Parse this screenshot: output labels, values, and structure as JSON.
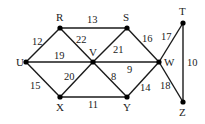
{
  "diagram": {
    "type": "weighted-undirected-graph",
    "nodes": [
      {
        "id": "U",
        "x": 26,
        "y": 62,
        "lx": 16,
        "ly": 66
      },
      {
        "id": "R",
        "x": 60,
        "y": 28,
        "lx": 56,
        "ly": 21
      },
      {
        "id": "V",
        "x": 93,
        "y": 62,
        "lx": 89,
        "ly": 56
      },
      {
        "id": "X",
        "x": 60,
        "y": 97,
        "lx": 56,
        "ly": 111
      },
      {
        "id": "S",
        "x": 127,
        "y": 28,
        "lx": 123,
        "ly": 21
      },
      {
        "id": "W",
        "x": 159,
        "y": 62,
        "lx": 164,
        "ly": 66
      },
      {
        "id": "Y",
        "x": 127,
        "y": 97,
        "lx": 123,
        "ly": 111
      },
      {
        "id": "T",
        "x": 183,
        "y": 23,
        "lx": 179,
        "ly": 15
      },
      {
        "id": "Z",
        "x": 183,
        "y": 102,
        "lx": 179,
        "ly": 116
      }
    ],
    "edges": [
      {
        "from": "U",
        "to": "R",
        "weight": "12",
        "lx": 32,
        "ly": 45
      },
      {
        "from": "U",
        "to": "V",
        "weight": "19",
        "lx": 54,
        "ly": 59
      },
      {
        "from": "U",
        "to": "X",
        "weight": "15",
        "lx": 30,
        "ly": 89
      },
      {
        "from": "R",
        "to": "S",
        "weight": "13",
        "lx": 87,
        "ly": 23
      },
      {
        "from": "R",
        "to": "V",
        "weight": "22",
        "lx": 76,
        "ly": 43
      },
      {
        "from": "X",
        "to": "V",
        "weight": "20",
        "lx": 64,
        "ly": 80
      },
      {
        "from": "X",
        "to": "Y",
        "weight": "11",
        "lx": 88,
        "ly": 108
      },
      {
        "from": "V",
        "to": "S",
        "weight": "21",
        "lx": 113,
        "ly": 53
      },
      {
        "from": "V",
        "to": "W",
        "weight": "9",
        "lx": 127,
        "ly": 73
      },
      {
        "from": "V",
        "to": "Y",
        "weight": "8",
        "lx": 111,
        "ly": 80
      },
      {
        "from": "S",
        "to": "W",
        "weight": "16",
        "lx": 142,
        "ly": 42
      },
      {
        "from": "Y",
        "to": "W",
        "weight": "14",
        "lx": 140,
        "ly": 91
      },
      {
        "from": "W",
        "to": "T",
        "weight": "17",
        "lx": 161,
        "ly": 40
      },
      {
        "from": "W",
        "to": "Z",
        "weight": "18",
        "lx": 160,
        "ly": 89
      },
      {
        "from": "T",
        "to": "Z",
        "weight": "10",
        "lx": 187,
        "ly": 66
      }
    ]
  }
}
